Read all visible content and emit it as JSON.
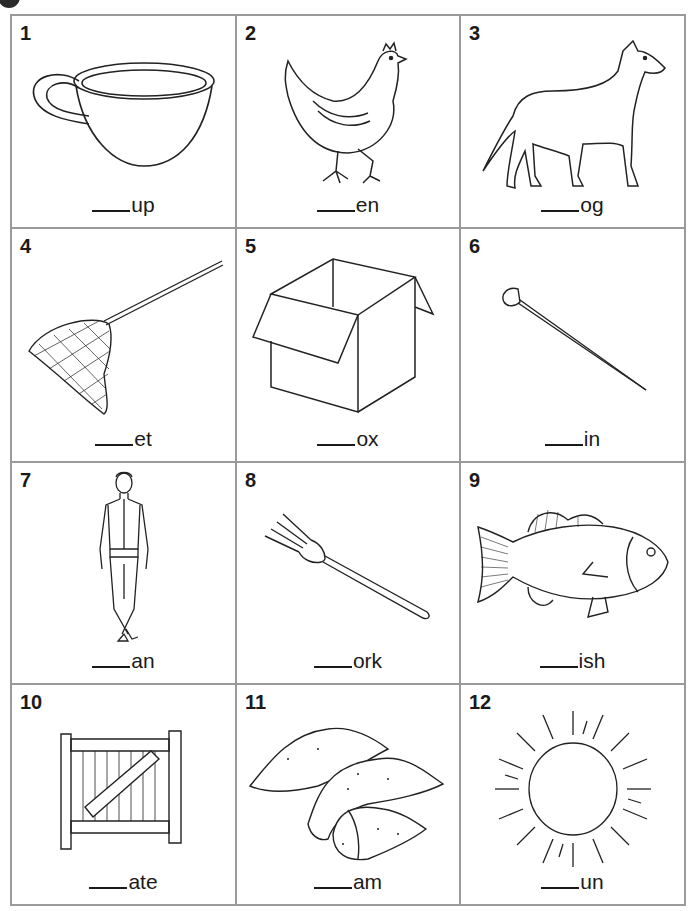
{
  "worksheet": {
    "items": [
      {
        "number": "1",
        "blank": "____",
        "ending": "up",
        "picture": "cup"
      },
      {
        "number": "2",
        "blank": "____",
        "ending": "en",
        "picture": "hen"
      },
      {
        "number": "3",
        "blank": "____",
        "ending": "og",
        "picture": "dog"
      },
      {
        "number": "4",
        "blank": "____",
        "ending": "et",
        "picture": "net"
      },
      {
        "number": "5",
        "blank": "____",
        "ending": "ox",
        "picture": "box"
      },
      {
        "number": "6",
        "blank": "____",
        "ending": "in",
        "picture": "pin"
      },
      {
        "number": "7",
        "blank": "____",
        "ending": "an",
        "picture": "man"
      },
      {
        "number": "8",
        "blank": "____",
        "ending": "ork",
        "picture": "fork"
      },
      {
        "number": "9",
        "blank": "____",
        "ending": "ish",
        "picture": "fish"
      },
      {
        "number": "10",
        "blank": "____",
        "ending": "ate",
        "picture": "gate"
      },
      {
        "number": "11",
        "blank": "____",
        "ending": "am",
        "picture": "yam"
      },
      {
        "number": "12",
        "blank": "____",
        "ending": "un",
        "picture": "sun"
      }
    ]
  }
}
